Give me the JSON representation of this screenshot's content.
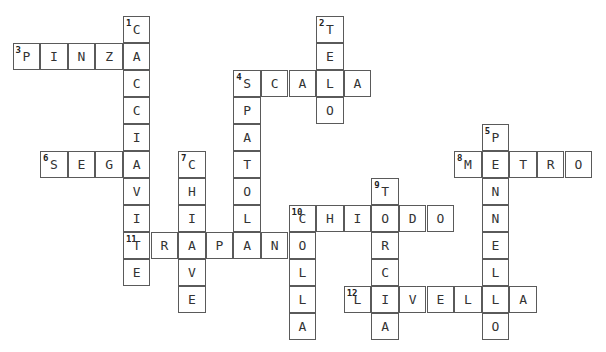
{
  "puzzle": {
    "type": "crossword",
    "origin": {
      "x": 13,
      "y": 16
    },
    "cell_w": 27.6,
    "cell_h": 27,
    "words": [
      {
        "number": 1,
        "direction": "down",
        "answer": "CACCIAVITE",
        "row": 0,
        "col": 4
      },
      {
        "number": 2,
        "direction": "down",
        "answer": "TELO",
        "row": 0,
        "col": 11
      },
      {
        "number": 3,
        "direction": "across",
        "answer": "PINZA",
        "row": 1,
        "col": 0
      },
      {
        "number": 4,
        "direction": "across",
        "answer": "SCALA",
        "row": 2,
        "col": 8
      },
      {
        "number": 4,
        "direction": "down",
        "answer": "SPATOLA",
        "row": 2,
        "col": 8
      },
      {
        "number": 5,
        "direction": "down",
        "answer": "PENNELLO",
        "row": 4,
        "col": 17
      },
      {
        "number": 6,
        "direction": "across",
        "answer": "SEGA",
        "row": 5,
        "col": 1
      },
      {
        "number": 7,
        "direction": "down",
        "answer": "CHIAVE",
        "row": 5,
        "col": 6
      },
      {
        "number": 8,
        "direction": "across",
        "answer": "METRO",
        "row": 5,
        "col": 16
      },
      {
        "number": 9,
        "direction": "down",
        "answer": "TORCIA",
        "row": 6,
        "col": 13
      },
      {
        "number": 10,
        "direction": "across",
        "answer": "CHIODO",
        "row": 7,
        "col": 10
      },
      {
        "number": 10,
        "direction": "down",
        "answer": "COLLA",
        "row": 7,
        "col": 10
      },
      {
        "number": 11,
        "direction": "across",
        "answer": "TRAPANO",
        "row": 8,
        "col": 4
      },
      {
        "number": 12,
        "direction": "across",
        "answer": "LIVELLA",
        "row": 10,
        "col": 12
      }
    ]
  }
}
